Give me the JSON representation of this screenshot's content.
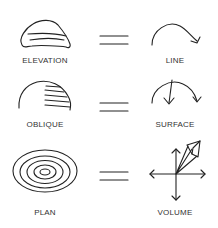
{
  "rows": [
    {
      "left_label": "ELEVATION",
      "right_label": "LINE",
      "left_icon": "elevation-profile-icon",
      "right_icon": "line-arc-icon"
    },
    {
      "left_label": "OBLIQUE",
      "right_label": "SURFACE",
      "left_icon": "oblique-dome-icon",
      "right_icon": "surface-arc-icon"
    },
    {
      "left_label": "PLAN",
      "right_label": "VOLUME",
      "left_icon": "plan-contour-icon",
      "right_icon": "volume-axes-icon"
    }
  ],
  "equals_symbol": "="
}
